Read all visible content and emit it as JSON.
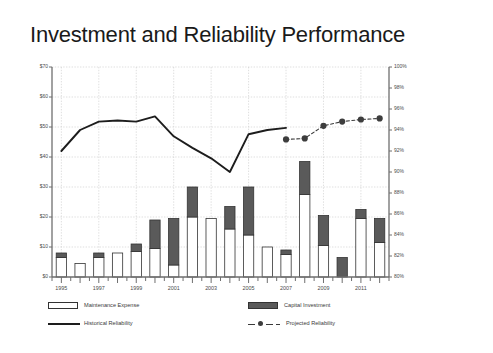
{
  "slide": {
    "title": "Investment and Reliability Performance",
    "background": "#ffffff"
  },
  "colors": {
    "maintenance_fill": "#ffffff",
    "maintenance_stroke": "#333333",
    "capital_fill": "#5a5a5a",
    "capital_stroke": "#333333",
    "historical_line": "#1d1d1d",
    "projected_line": "#3d3d3d",
    "axis": "#6f6f6f",
    "grid": "#c9c9c9",
    "text": "#4a4a4a",
    "title": "#1a1a1a"
  },
  "legend": {
    "items": [
      {
        "key": "maintenance",
        "label": "Maintenance Expense",
        "marker": "open-bar"
      },
      {
        "key": "capital",
        "label": "Capital Investment",
        "marker": "filled-bar"
      },
      {
        "key": "historical",
        "label": "Historical Reliability",
        "marker": "solid-line"
      },
      {
        "key": "projected",
        "label": "Projected Reliability",
        "marker": "dashed-line-dot"
      }
    ]
  },
  "chart_data": {
    "type": "bar",
    "title": "Investment and Reliability Performance",
    "xlabel": "",
    "ylabel": "",
    "grid": true,
    "legend_position": "bottom",
    "x": [
      1995,
      1996,
      1997,
      1998,
      1999,
      2000,
      2001,
      2002,
      2003,
      2004,
      2005,
      2006,
      2007,
      2008,
      2009,
      2010,
      2011,
      2012
    ],
    "x_tick_labels": [
      "1995",
      "",
      "1997",
      "",
      "1999",
      "",
      "2001",
      "",
      "2003",
      "",
      "2005",
      "",
      "2007",
      "",
      "2009",
      "",
      "2011",
      ""
    ],
    "left_axis": {
      "label": "",
      "ylim": [
        0,
        70
      ],
      "tick_values": [
        0,
        10,
        20,
        30,
        40,
        50,
        60,
        70
      ],
      "tick_labels": [
        "$0",
        "$10",
        "$20",
        "$30",
        "$40",
        "$50",
        "$60",
        "$70"
      ],
      "unit": "$"
    },
    "right_axis": {
      "label": "",
      "ylim": [
        80,
        100
      ],
      "tick_values": [
        80,
        82,
        84,
        86,
        88,
        90,
        92,
        94,
        96,
        98,
        100
      ],
      "tick_labels": [
        "80%",
        "82%",
        "84%",
        "86%",
        "88%",
        "90%",
        "92%",
        "94%",
        "96%",
        "98%",
        "100%"
      ],
      "unit": "%"
    },
    "series": [
      {
        "name": "Maintenance Expense",
        "type": "bar",
        "axis": "left",
        "stacked": true,
        "values": [
          6.5,
          4.5,
          6.5,
          8.0,
          8.5,
          9.5,
          4.0,
          20.0,
          19.5,
          16.0,
          14.0,
          10.0,
          7.5,
          27.5,
          10.5,
          0.0,
          19.5,
          11.5
        ]
      },
      {
        "name": "Capital Investment",
        "type": "bar",
        "axis": "left",
        "stacked": true,
        "values": [
          1.5,
          0.0,
          1.5,
          0.0,
          2.5,
          9.5,
          15.5,
          10.0,
          0.0,
          7.5,
          16.0,
          0.0,
          1.5,
          11.0,
          10.0,
          6.5,
          3.0,
          8.0
        ]
      },
      {
        "name": "Historical Reliability",
        "type": "line",
        "axis": "right",
        "style": "solid",
        "values": [
          92.0,
          94.0,
          94.8,
          94.9,
          94.8,
          95.3,
          93.4,
          92.3,
          91.3,
          90.0,
          93.6,
          94.0,
          94.2,
          null,
          null,
          null,
          null,
          null
        ]
      },
      {
        "name": "Projected Reliability",
        "type": "line",
        "axis": "right",
        "style": "dashed",
        "marker": "circle",
        "values": [
          null,
          null,
          null,
          null,
          null,
          null,
          null,
          null,
          null,
          null,
          null,
          null,
          93.1,
          93.2,
          94.4,
          94.8,
          95.0,
          95.1
        ]
      }
    ]
  }
}
